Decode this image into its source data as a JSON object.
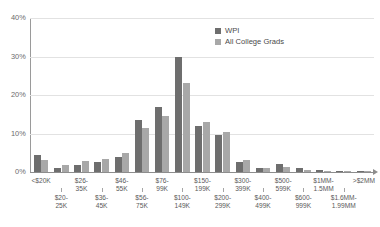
{
  "chart_data": {
    "type": "bar",
    "title": "",
    "xlabel": "",
    "ylabel": "",
    "ylim": [
      0,
      40
    ],
    "yticks": [
      "0%",
      "10%",
      "20%",
      "30%",
      "40%"
    ],
    "ytick_values": [
      0,
      10,
      20,
      30,
      40
    ],
    "grid": true,
    "legend_position": "top-right",
    "categories": [
      "<$20K",
      "$20-25K",
      "$26-35K",
      "$36-45K",
      "$46-55K",
      "$56-75K",
      "$76-99K",
      "$100-149K",
      "$150-199K",
      "$200-299K",
      "$300-399K",
      "$400-499K",
      "$500-599K",
      "$600-999K",
      "$1MM-1.5MM",
      "$1.6MM-1.99MM",
      ">$2MM"
    ],
    "category_labels": [
      {
        "line1": "<$20K",
        "line2": "",
        "row": "top"
      },
      {
        "line1": "$20-",
        "line2": "25K",
        "row": "bottom"
      },
      {
        "line1": "$26-",
        "line2": "35K",
        "row": "top"
      },
      {
        "line1": "$36-",
        "line2": "45K",
        "row": "bottom"
      },
      {
        "line1": "$46-",
        "line2": "55K",
        "row": "top"
      },
      {
        "line1": "$56-",
        "line2": "75K",
        "row": "bottom"
      },
      {
        "line1": "$76-",
        "line2": "99K",
        "row": "top"
      },
      {
        "line1": "$100-",
        "line2": "149K",
        "row": "bottom"
      },
      {
        "line1": "$150-",
        "line2": "199K",
        "row": "top"
      },
      {
        "line1": "$200-",
        "line2": "299K",
        "row": "bottom"
      },
      {
        "line1": "$300-",
        "line2": "399K",
        "row": "top"
      },
      {
        "line1": "$400-",
        "line2": "499K",
        "row": "bottom"
      },
      {
        "line1": "$500-",
        "line2": "599K",
        "row": "top"
      },
      {
        "line1": "$600-",
        "line2": "999K",
        "row": "bottom"
      },
      {
        "line1": "$1MM-",
        "line2": "1.5MM",
        "row": "top"
      },
      {
        "line1": "$1.6MM-",
        "line2": "1.99MM",
        "row": "bottom"
      },
      {
        "line1": ">$2MM",
        "line2": "",
        "row": "top"
      }
    ],
    "series": [
      {
        "name": "WPI",
        "color": "#6e6e6e",
        "values": [
          4.5,
          1.0,
          1.8,
          2.5,
          4.0,
          13.5,
          17.0,
          30.0,
          12.0,
          9.5,
          2.5,
          1.0,
          2.0,
          1.0,
          0.4,
          0.3,
          0.2
        ]
      },
      {
        "name": "All College Grads",
        "color": "#a8a8a8",
        "values": [
          3.0,
          1.8,
          2.8,
          3.5,
          5.0,
          11.5,
          14.5,
          23.0,
          13.0,
          10.5,
          3.0,
          1.0,
          1.2,
          0.5,
          0.3,
          0.2,
          0.2
        ]
      }
    ]
  },
  "colors": {
    "wpi": "#6e6e6e",
    "all_college_grads": "#a8a8a8",
    "gridline": "#e2e2e2",
    "axis": "#8d8d8d",
    "text": "#4a4a4a"
  }
}
